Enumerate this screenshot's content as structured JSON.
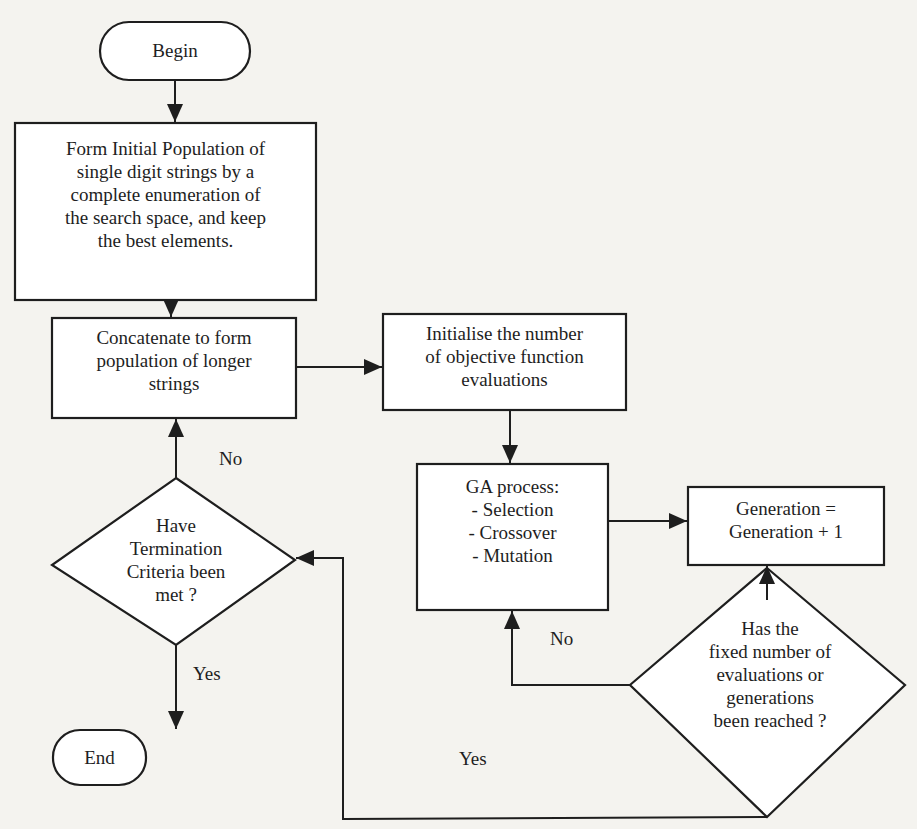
{
  "diagram": {
    "type": "flowchart",
    "colors": {
      "stroke": "#1e1e1e",
      "background": "#f4f3ef",
      "node_fill": "#ffffff"
    },
    "nodes": {
      "begin": {
        "shape": "terminal",
        "text": "Begin"
      },
      "initial_population": {
        "shape": "process",
        "text": "Form Initial Population of\nsingle digit strings  by a\ncomplete enumeration of\nthe search space, and keep\nthe best elements."
      },
      "concatenate": {
        "shape": "process",
        "text": "Concatenate to form\npopulation of longer\nstrings"
      },
      "initialise": {
        "shape": "process",
        "text": "Initialise the number\nof  objective function\nevaluations"
      },
      "ga_process": {
        "shape": "process",
        "text": "GA process:\n- Selection\n- Crossover\n- Mutation"
      },
      "generation": {
        "shape": "process",
        "text": "Generation =\nGeneration + 1"
      },
      "fixed_number_check": {
        "shape": "decision",
        "text": "Has the\nfixed number of\nevaluations or\ngenerations\nbeen reached ?"
      },
      "termination_check": {
        "shape": "decision",
        "text": "Have\nTermination\nCriteria been\nmet ?"
      },
      "end": {
        "shape": "terminal",
        "text": "End"
      }
    },
    "edge_labels": {
      "termination_no": "No",
      "termination_yes": "Yes",
      "fixed_no": "No",
      "fixed_yes": "Yes"
    },
    "edges": [
      {
        "from": "begin",
        "to": "initial_population"
      },
      {
        "from": "initial_population",
        "to": "concatenate"
      },
      {
        "from": "concatenate",
        "to": "initialise"
      },
      {
        "from": "initialise",
        "to": "ga_process"
      },
      {
        "from": "ga_process",
        "to": "generation"
      },
      {
        "from": "fixed_number_check",
        "to": "generation"
      },
      {
        "from": "fixed_number_check",
        "to": "ga_process",
        "label": "No"
      },
      {
        "from": "fixed_number_check",
        "to": "termination_check",
        "label": "Yes"
      },
      {
        "from": "termination_check",
        "to": "concatenate",
        "label": "No"
      },
      {
        "from": "termination_check",
        "to": "end",
        "label": "Yes"
      }
    ]
  }
}
